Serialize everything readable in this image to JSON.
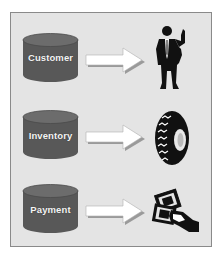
{
  "diagram": {
    "rows": [
      {
        "label": "Customer",
        "source_icon": "database-cylinder-icon",
        "connector_icon": "arrow-right-icon",
        "target_icon": "businessman-icon"
      },
      {
        "label": "Inventory",
        "source_icon": "database-cylinder-icon",
        "connector_icon": "arrow-right-icon",
        "target_icon": "tire-icon"
      },
      {
        "label": "Payment",
        "source_icon": "database-cylinder-icon",
        "connector_icon": "arrow-right-icon",
        "target_icon": "money-hand-icon"
      }
    ],
    "colors": {
      "panel_background": "#e4e4e4",
      "panel_border": "#8a8a8a",
      "cylinder_body": "#5a5a5a",
      "cylinder_top": "#6e6e6e",
      "label_text": "#f4f4f4",
      "arrow_fill": "#ffffff",
      "arrow_shadow": "#9a9a9a",
      "silhouette": "#111111"
    }
  }
}
